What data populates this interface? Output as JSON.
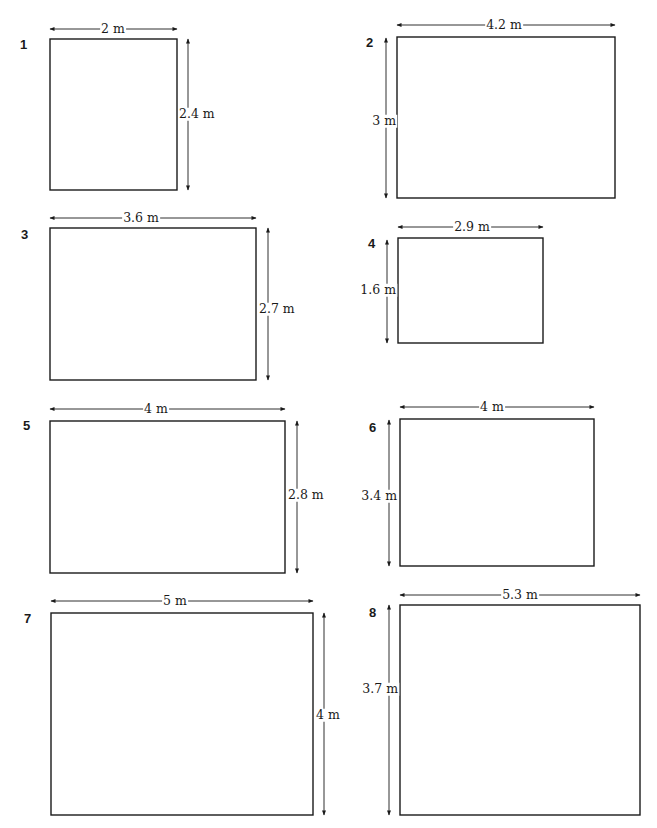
{
  "header": {
    "caption": ""
  },
  "figures": [
    {
      "number": "1",
      "width_label": "2 m",
      "height_label": "2.4 m",
      "width_m": 2,
      "height_m": 2.4,
      "height_side": "right"
    },
    {
      "number": "2",
      "width_label": "4.2 m",
      "height_label": "3 m",
      "width_m": 4.2,
      "height_m": 3,
      "height_side": "left"
    },
    {
      "number": "3",
      "width_label": "3.6 m",
      "height_label": "2.7 m",
      "width_m": 3.6,
      "height_m": 2.7,
      "height_side": "right"
    },
    {
      "number": "4",
      "width_label": "2.9 m",
      "height_label": "1.6 m",
      "width_m": 2.9,
      "height_m": 1.6,
      "height_side": "left"
    },
    {
      "number": "5",
      "width_label": "4 m",
      "height_label": "2.8 m",
      "width_m": 4,
      "height_m": 2.8,
      "height_side": "right"
    },
    {
      "number": "6",
      "width_label": "4 m",
      "height_label": "3.4 m",
      "width_m": 4,
      "height_m": 3.4,
      "height_side": "left"
    },
    {
      "number": "7",
      "width_label": "5 m",
      "height_label": "4 m",
      "width_m": 5,
      "height_m": 4,
      "height_side": "right"
    },
    {
      "number": "8",
      "width_label": "5.3 m",
      "height_label": "3.7 m",
      "width_m": 5.3,
      "height_m": 3.7,
      "height_side": "left"
    }
  ],
  "colors": {
    "line": "#1a1a1a",
    "background": "#ffffff"
  }
}
